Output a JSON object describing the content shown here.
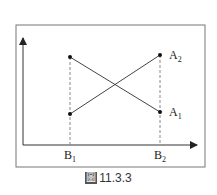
{
  "figure": {
    "caption_prefix": "圖",
    "caption_number": "11.3.3"
  },
  "labels": {
    "a1": "A",
    "a1_sub": "1",
    "a2": "A",
    "a2_sub": "2",
    "b1": "B",
    "b1_sub": "1",
    "b2": "B",
    "b2_sub": "2"
  },
  "colors": {
    "line": "#444444",
    "frame": "#777777",
    "dash": "#888888"
  }
}
